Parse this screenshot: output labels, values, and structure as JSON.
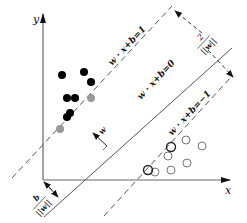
{
  "diagram": {
    "type": "svm-margin-diagram",
    "axes": {
      "x_label": "x",
      "y_label": "y"
    },
    "hyperplanes": [
      {
        "name": "positive-margin",
        "label": "w · x+b=1",
        "style": "dashed"
      },
      {
        "name": "decision-boundary",
        "label": "w · x+b=0",
        "style": "solid"
      },
      {
        "name": "negative-margin",
        "label": "w · x+b=−1",
        "style": "dashed"
      }
    ],
    "annotations": {
      "margin_width": {
        "numerator": "2",
        "denominator": "||w||"
      },
      "normal_vector": "w",
      "offset": {
        "numerator": "b",
        "denominator": "||w||"
      }
    },
    "colors": {
      "positive_points": "#000000",
      "support_vectors_positive": "#999999",
      "negative_points_stroke": "#777777",
      "support_vectors_negative_stroke": "#222222",
      "lines": "#555555"
    },
    "points": {
      "positive": [
        [
          62,
          75
        ],
        [
          84,
          72
        ],
        [
          91,
          81
        ],
        [
          67,
          98
        ],
        [
          75,
          98
        ],
        [
          67,
          117
        ],
        [
          70,
          113
        ]
      ],
      "positive_support": [
        [
          91,
          98
        ],
        [
          60,
          129
        ]
      ],
      "negative": [
        [
          186,
          140
        ],
        [
          202,
          146
        ],
        [
          185,
          155
        ],
        [
          171,
          156
        ],
        [
          187,
          169
        ],
        [
          171,
          170
        ],
        [
          155,
          170
        ],
        [
          154,
          172
        ]
      ],
      "negative_support": [
        [
          171,
          147
        ],
        [
          148,
          170
        ]
      ]
    }
  }
}
